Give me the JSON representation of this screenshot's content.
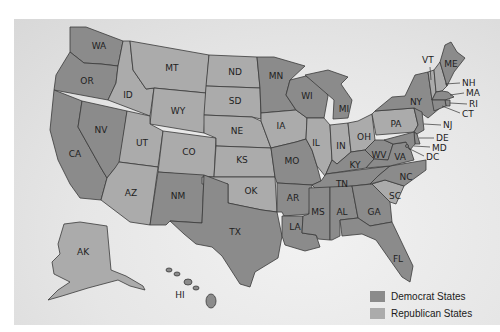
{
  "map": {
    "type": "us-states-choropleth",
    "colors": {
      "democrat": "#8b8b8b",
      "republican": "#ababab",
      "background": "#e4e4e4"
    },
    "states": [
      {
        "abbr": "WA",
        "party": "democrat"
      },
      {
        "abbr": "OR",
        "party": "democrat"
      },
      {
        "abbr": "CA",
        "party": "democrat"
      },
      {
        "abbr": "NV",
        "party": "democrat"
      },
      {
        "abbr": "ID",
        "party": "republican"
      },
      {
        "abbr": "MT",
        "party": "republican"
      },
      {
        "abbr": "WY",
        "party": "republican"
      },
      {
        "abbr": "UT",
        "party": "republican"
      },
      {
        "abbr": "CO",
        "party": "republican"
      },
      {
        "abbr": "AZ",
        "party": "republican"
      },
      {
        "abbr": "NM",
        "party": "democrat"
      },
      {
        "abbr": "ND",
        "party": "republican"
      },
      {
        "abbr": "SD",
        "party": "republican"
      },
      {
        "abbr": "NE",
        "party": "republican"
      },
      {
        "abbr": "KS",
        "party": "republican"
      },
      {
        "abbr": "OK",
        "party": "republican"
      },
      {
        "abbr": "TX",
        "party": "democrat"
      },
      {
        "abbr": "MN",
        "party": "democrat"
      },
      {
        "abbr": "IA",
        "party": "republican"
      },
      {
        "abbr": "MO",
        "party": "democrat"
      },
      {
        "abbr": "AR",
        "party": "democrat"
      },
      {
        "abbr": "LA",
        "party": "democrat"
      },
      {
        "abbr": "WI",
        "party": "democrat"
      },
      {
        "abbr": "IL",
        "party": "republican"
      },
      {
        "abbr": "MS",
        "party": "democrat"
      },
      {
        "abbr": "MI",
        "party": "democrat"
      },
      {
        "abbr": "IN",
        "party": "republican"
      },
      {
        "abbr": "KY",
        "party": "democrat"
      },
      {
        "abbr": "TN",
        "party": "democrat"
      },
      {
        "abbr": "AL",
        "party": "democrat"
      },
      {
        "abbr": "OH",
        "party": "republican"
      },
      {
        "abbr": "WV",
        "party": "democrat"
      },
      {
        "abbr": "GA",
        "party": "democrat"
      },
      {
        "abbr": "FL",
        "party": "democrat"
      },
      {
        "abbr": "SC",
        "party": "republican"
      },
      {
        "abbr": "NC",
        "party": "democrat"
      },
      {
        "abbr": "VA",
        "party": "democrat"
      },
      {
        "abbr": "PA",
        "party": "republican"
      },
      {
        "abbr": "NY",
        "party": "democrat"
      },
      {
        "abbr": "VT",
        "party": "republican"
      },
      {
        "abbr": "NH",
        "party": "republican"
      },
      {
        "abbr": "ME",
        "party": "democrat"
      },
      {
        "abbr": "MA",
        "party": "democrat"
      },
      {
        "abbr": "RI",
        "party": "democrat"
      },
      {
        "abbr": "CT",
        "party": "democrat"
      },
      {
        "abbr": "NJ",
        "party": "democrat"
      },
      {
        "abbr": "DE",
        "party": "democrat"
      },
      {
        "abbr": "MD",
        "party": "democrat"
      },
      {
        "abbr": "DC",
        "party": "democrat"
      },
      {
        "abbr": "AK",
        "party": "republican"
      },
      {
        "abbr": "HI",
        "party": "democrat"
      }
    ],
    "labels": {
      "WA": "WA",
      "OR": "OR",
      "CA": "CA",
      "NV": "NV",
      "ID": "ID",
      "MT": "MT",
      "WY": "WY",
      "UT": "UT",
      "CO": "CO",
      "AZ": "AZ",
      "NM": "NM",
      "ND": "ND",
      "SD": "SD",
      "NE": "NE",
      "KS": "KS",
      "OK": "OK",
      "TX": "TX",
      "MN": "MN",
      "IA": "IA",
      "MO": "MO",
      "AR": "AR",
      "LA": "LA",
      "WI": "WI",
      "IL": "IL",
      "MS": "MS",
      "MI": "MI",
      "IN": "IN",
      "KY": "KY",
      "TN": "TN",
      "AL": "AL",
      "OH": "OH",
      "WV": "WV",
      "GA": "GA",
      "FL": "FL",
      "SC": "SC",
      "NC": "NC",
      "VA": "VA",
      "PA": "PA",
      "NY": "NY",
      "VT": "VT",
      "NH": "NH",
      "ME": "ME",
      "MA": "MA",
      "RI": "RI",
      "CT": "CT",
      "NJ": "NJ",
      "DE": "DE",
      "MD": "MD",
      "DC": "DC",
      "AK": "AK",
      "HI": "HI"
    }
  },
  "legend": {
    "items": [
      {
        "label": "Democrat States",
        "color": "#8b8b8b"
      },
      {
        "label": "Republican States",
        "color": "#ababab"
      }
    ]
  }
}
